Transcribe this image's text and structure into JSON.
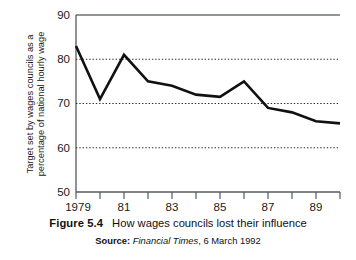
{
  "figure": {
    "label": "Figure 5.4",
    "title": "How wages councils lost their influence",
    "source_label": "Source:",
    "source_publication": "Financial Times",
    "source_date": ", 6 March 1992"
  },
  "axis": {
    "y_title_line1": "Target set by wages councils as a",
    "y_title_line2": "percentage of national hourly wage"
  },
  "chart_data": {
    "type": "line",
    "title": "How wages councils lost their influence",
    "xlabel": "",
    "ylabel": "Target set by wages councils as a percentage of national hourly wage",
    "x": [
      1979,
      1980,
      1981,
      1982,
      1983,
      1984,
      1985,
      1986,
      1987,
      1988,
      1989,
      1990
    ],
    "values": [
      83,
      71,
      81,
      75,
      74,
      72,
      71.5,
      75,
      69,
      68,
      66,
      65.5
    ],
    "series": [
      {
        "name": "Target as % of national hourly wage",
        "values": [
          83,
          71,
          81,
          75,
          74,
          72,
          71.5,
          75,
          69,
          68,
          66,
          65.5
        ]
      }
    ],
    "xlim": [
      1979,
      1990
    ],
    "ylim": [
      50,
      90
    ],
    "y_ticks": [
      50,
      60,
      70,
      80,
      90
    ],
    "y_tick_labels": [
      "50",
      "60",
      "70",
      "80",
      "90"
    ],
    "x_ticks": [
      1979,
      1980,
      1981,
      1982,
      1983,
      1984,
      1985,
      1986,
      1987,
      1988,
      1989,
      1990
    ],
    "x_tick_labels": [
      "1979",
      "",
      "81",
      "",
      "83",
      "",
      "85",
      "",
      "87",
      "",
      "89",
      ""
    ],
    "gridlines": [
      60,
      70,
      80
    ],
    "grid": "horizontal-dotted",
    "legend": "none",
    "line_color": "#111111"
  },
  "y_tick_values": [
    "90",
    "80",
    "70",
    "60",
    "50"
  ],
  "x_tick_values": [
    "1979",
    "81",
    "83",
    "85",
    "87",
    "89"
  ]
}
